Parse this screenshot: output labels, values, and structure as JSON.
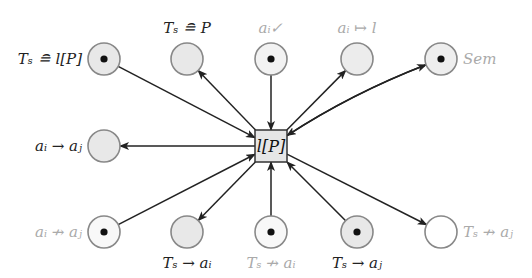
{
  "diagram": {
    "type": "petri-net",
    "transition": {
      "id": "lP",
      "label": "l[P]",
      "x": 271,
      "y": 146,
      "size": 32,
      "fill": "#e6e6e6"
    },
    "places": [
      {
        "id": "p1",
        "label": "Tₛ ≘ l[P]",
        "x": 104,
        "y": 59,
        "token": true,
        "fill": "#e8e8e8",
        "label_pos": "left",
        "label_color": "dark"
      },
      {
        "id": "p2",
        "label": "Tₛ ≘ P",
        "x": 187,
        "y": 59,
        "token": false,
        "fill": "#e8e8e8",
        "label_pos": "top",
        "label_color": "dark"
      },
      {
        "id": "p3",
        "label": "aᵢ✓",
        "x": 271,
        "y": 59,
        "token": true,
        "fill": "#f2f2f2",
        "label_pos": "top",
        "label_color": "light"
      },
      {
        "id": "p4",
        "label": "aᵢ ↦ l",
        "x": 357,
        "y": 59,
        "token": false,
        "fill": "#ececec",
        "label_pos": "top",
        "label_color": "light"
      },
      {
        "id": "p5",
        "label": "Sem",
        "x": 441,
        "y": 59,
        "token": true,
        "fill": "#eeeeee",
        "label_pos": "right",
        "label_color": "light"
      },
      {
        "id": "p6",
        "label": "aᵢ → aⱼ",
        "x": 104,
        "y": 146,
        "token": false,
        "fill": "#e8e8e8",
        "label_pos": "left",
        "label_color": "dark"
      },
      {
        "id": "p7",
        "label": "aᵢ ↛ aⱼ",
        "x": 104,
        "y": 232,
        "token": true,
        "fill": "#f8f8f8",
        "label_pos": "left",
        "label_color": "light"
      },
      {
        "id": "p8",
        "label": "Tₛ → aᵢ",
        "x": 187,
        "y": 232,
        "token": false,
        "fill": "#e8e8e8",
        "label_pos": "bottom",
        "label_color": "dark"
      },
      {
        "id": "p9",
        "label": "Tₛ ↛ aᵢ",
        "x": 271,
        "y": 232,
        "token": true,
        "fill": "#f8f8f8",
        "label_pos": "bottom",
        "label_color": "light"
      },
      {
        "id": "p10",
        "label": "Tₛ → aⱼ",
        "x": 357,
        "y": 232,
        "token": true,
        "fill": "#e8e8e8",
        "label_pos": "bottom",
        "label_color": "dark"
      },
      {
        "id": "p11",
        "label": "Tₛ ↛ aⱼ",
        "x": 441,
        "y": 232,
        "token": false,
        "fill": "#ffffff",
        "label_pos": "right",
        "label_color": "light"
      }
    ],
    "arcs": [
      {
        "from": "p1",
        "to": "lP"
      },
      {
        "from": "lP",
        "to": "p2"
      },
      {
        "from": "p3",
        "to": "lP"
      },
      {
        "from": "lP",
        "to": "p4"
      },
      {
        "from": "lP",
        "to": "p5",
        "curve": -1
      },
      {
        "from": "p5",
        "to": "lP",
        "curve": 1
      },
      {
        "from": "lP",
        "to": "p6"
      },
      {
        "from": "p7",
        "to": "lP"
      },
      {
        "from": "lP",
        "to": "p8"
      },
      {
        "from": "p9",
        "to": "lP"
      },
      {
        "from": "p10",
        "to": "lP"
      },
      {
        "from": "lP",
        "to": "p11"
      }
    ]
  }
}
